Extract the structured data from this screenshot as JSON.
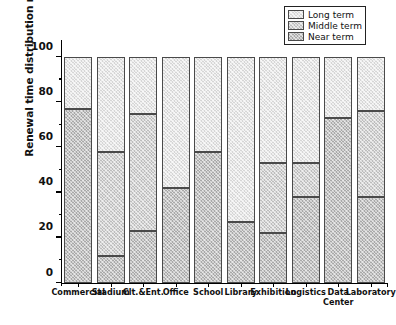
{
  "chart_data": {
    "type": "bar",
    "subtype": "stacked-100-percent",
    "title": "",
    "xlabel": "",
    "ylabel": "Renewal time distribution ratio (%)",
    "ylim": [
      0,
      100
    ],
    "yticks": [
      0,
      20,
      40,
      60,
      80,
      100
    ],
    "ytick_labels": [
      "0",
      "20",
      "40",
      "60",
      "80",
      "100"
    ],
    "minor_ticks": [
      10,
      30,
      50,
      70,
      90
    ],
    "grid": false,
    "legend_position": "top-right",
    "categories": [
      "Commercial",
      "Stadium",
      "Clt.&Ent.",
      "Office",
      "School",
      "Library",
      "Exhibition",
      "Logistics",
      "Data\nCenter",
      "Laboratory"
    ],
    "series": [
      {
        "name": "Near term",
        "color": "#a9a9a9",
        "values": [
          77,
          12,
          23,
          42,
          58,
          27,
          22,
          38,
          73,
          38
        ]
      },
      {
        "name": "Middle term",
        "color": "#bdbdbd",
        "values": [
          0,
          46,
          52,
          0,
          0,
          0,
          31,
          15,
          0,
          38
        ]
      },
      {
        "name": "Long term",
        "color": "#d6d6d6",
        "values": [
          23,
          42,
          25,
          58,
          42,
          73,
          47,
          47,
          27,
          24
        ]
      }
    ],
    "cumulative_tops": {
      "near": [
        77,
        12,
        23,
        42,
        58,
        27,
        22,
        38,
        73,
        38
      ],
      "middle": [
        77,
        58,
        75,
        42,
        58,
        27,
        53,
        53,
        73,
        76
      ]
    }
  },
  "legend": {
    "items": [
      {
        "label": "Long term",
        "key": "long"
      },
      {
        "label": "Middle term",
        "key": "middle"
      },
      {
        "label": "Near term",
        "key": "near"
      }
    ]
  }
}
